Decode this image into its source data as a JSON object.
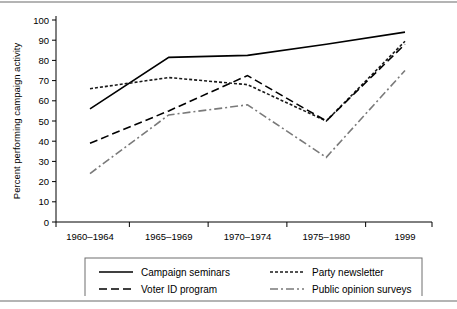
{
  "chart_data": {
    "type": "line",
    "title": "",
    "xlabel": "",
    "ylabel": "Percent performing campaign activity",
    "categories": [
      "1960–1964",
      "1965–1969",
      "1970–1974",
      "1975–1980",
      "1999"
    ],
    "ylim": [
      0,
      100
    ],
    "yticks": [
      0,
      10,
      20,
      30,
      40,
      50,
      60,
      70,
      80,
      90,
      100
    ],
    "grid": false,
    "legend_position": "bottom",
    "series": [
      {
        "name": "Campaign seminars",
        "style": "solid",
        "color": "#000000",
        "values": [
          56,
          81.5,
          82.5,
          88,
          94
        ]
      },
      {
        "name": "Party newsletter",
        "style": "dotted",
        "color": "#1a1a1a",
        "values": [
          66,
          71.5,
          68,
          50,
          89.5
        ]
      },
      {
        "name": "Voter ID program",
        "style": "dashed",
        "color": "#000000",
        "values": [
          39,
          55,
          72.5,
          50,
          88
        ]
      },
      {
        "name": "Public opinion surveys",
        "style": "dash-dot",
        "color": "#7a7a7a",
        "values": [
          24,
          53,
          58,
          32,
          75
        ]
      }
    ]
  },
  "axis": {
    "y_title": "Percent performing campaign activity",
    "y_tick_labels": [
      "100",
      "90",
      "80",
      "70",
      "60",
      "50",
      "40",
      "30",
      "20",
      "10",
      "0"
    ],
    "x_tick_labels": [
      "1960–1964",
      "1965–1969",
      "1970–1974",
      "1975–1980",
      "1999"
    ]
  },
  "legend": {
    "items": [
      {
        "label": "Campaign seminars",
        "style": "solid"
      },
      {
        "label": "Party newsletter",
        "style": "dotted"
      },
      {
        "label": "Voter ID program",
        "style": "dashed"
      },
      {
        "label": "Public opinion surveys",
        "style": "dash-dot"
      }
    ]
  },
  "colors": {
    "axis": "#000000",
    "rule": "#b4b4b4",
    "legend_border": "#6e6e6e",
    "muted_series": "#7a7a7a"
  }
}
